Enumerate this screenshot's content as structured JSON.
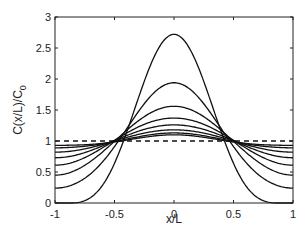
{
  "chart_data": {
    "type": "line",
    "title": "",
    "xlabel": "x/L",
    "ylabel": "C(x/L)/C",
    "ylabel_subscript": "0",
    "xlim": [
      -1,
      1
    ],
    "ylim": [
      0,
      3
    ],
    "xticks": [
      -1,
      -0.5,
      0,
      0.5,
      1
    ],
    "xtick_labels": [
      "-1",
      "-0.5",
      "0",
      "0.5",
      "1"
    ],
    "yticks": [
      0,
      0.5,
      1,
      1.5,
      2,
      2.5,
      3
    ],
    "ytick_labels": [
      "0",
      "0.5",
      "1",
      "1.5",
      "2",
      "2.5",
      "3"
    ],
    "grid": false,
    "legend": null,
    "reference_line": {
      "style": "dashed",
      "y": 1
    },
    "series": [
      {
        "name": "curve-1",
        "center": 2.72,
        "edge": 0.0
      },
      {
        "name": "curve-2",
        "center": 1.94,
        "edge": 0.24
      },
      {
        "name": "curve-3",
        "center": 1.56,
        "edge": 0.45
      },
      {
        "name": "curve-4",
        "center": 1.37,
        "edge": 0.61
      },
      {
        "name": "curve-5",
        "center": 1.26,
        "edge": 0.73
      },
      {
        "name": "curve-6",
        "center": 1.18,
        "edge": 0.82
      },
      {
        "name": "curve-7",
        "center": 1.13,
        "edge": 0.89
      },
      {
        "name": "curve-8",
        "center": 1.1,
        "edge": 0.93
      }
    ],
    "crossing_points_x": [
      -0.45,
      0.45
    ]
  },
  "colors": {
    "line": "#111111",
    "axis": "#222222"
  }
}
